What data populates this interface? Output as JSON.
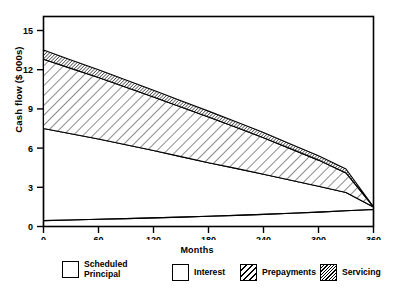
{
  "chart_data": {
    "type": "area",
    "title": "",
    "xlabel": "Months",
    "ylabel": "Cash flow ($ 000s)",
    "xlim": [
      0,
      360
    ],
    "ylim": [
      0,
      15
    ],
    "xticks": [
      0,
      60,
      120,
      180,
      240,
      300,
      360
    ],
    "yticks": [
      0,
      3,
      6,
      9,
      12,
      15
    ],
    "grid": false,
    "stacked": true,
    "legend_position": "below",
    "x": [
      0,
      30,
      60,
      90,
      120,
      150,
      180,
      210,
      240,
      270,
      300,
      330,
      360
    ],
    "series": [
      {
        "name": "Scheduled Principal",
        "fill": "none",
        "values": [
          0.45,
          0.5,
          0.55,
          0.6,
          0.66,
          0.72,
          0.78,
          0.85,
          0.93,
          1.01,
          1.1,
          1.2,
          1.3
        ]
      },
      {
        "name": "Interest",
        "fill": "none",
        "values": [
          7.05,
          6.6,
          6.15,
          5.65,
          5.15,
          4.63,
          4.1,
          3.6,
          3.07,
          2.53,
          1.98,
          1.4,
          0.2
        ]
      },
      {
        "name": "Prepayments",
        "fill": "diagonal-hatch",
        "values": [
          5.3,
          5.0,
          4.7,
          4.4,
          4.1,
          3.8,
          3.5,
          3.15,
          2.8,
          2.4,
          2.0,
          1.5,
          0.0
        ]
      },
      {
        "name": "Servicing",
        "fill": "dense-hatch",
        "values": [
          0.7,
          0.65,
          0.6,
          0.56,
          0.52,
          0.48,
          0.45,
          0.42,
          0.39,
          0.36,
          0.33,
          0.3,
          0.0
        ]
      }
    ],
    "cumulative_top": [
      13.5,
      12.75,
      12.0,
      11.21,
      10.43,
      9.63,
      8.83,
      8.02,
      7.19,
      6.3,
      5.41,
      4.4,
      1.5
    ]
  },
  "legend": {
    "items": [
      {
        "label": "Scheduled\nPrincipal",
        "swatch": "empty"
      },
      {
        "label": "Interest",
        "swatch": "empty"
      },
      {
        "label": "Prepayments",
        "swatch": "diagonal-hatch"
      },
      {
        "label": "Servicing",
        "swatch": "dense-hatch"
      }
    ]
  },
  "axes": {
    "x_title": "Months",
    "y_title": "Cash flow ($ 000s)",
    "xtick_labels": [
      "0",
      "60",
      "120",
      "180",
      "240",
      "300",
      "360"
    ],
    "ytick_labels": [
      "0",
      "3",
      "6",
      "9",
      "12",
      "15"
    ]
  },
  "colors": {
    "axis": "#000000",
    "plot_background": "#ffffff",
    "page_background": "#ffffff"
  }
}
